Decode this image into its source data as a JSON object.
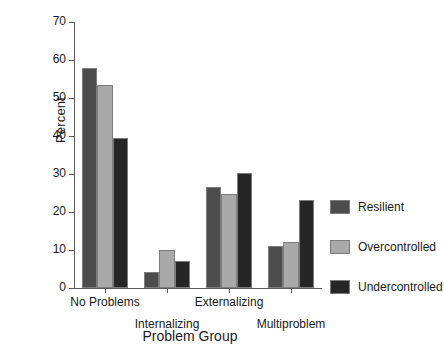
{
  "chart_data": {
    "type": "bar",
    "title": "",
    "xlabel": "Problem Group",
    "ylabel": "Percent",
    "categories": [
      "No Problems",
      "Internalizing",
      "Externalizing",
      "Multiproblem"
    ],
    "series": [
      {
        "name": "Resilient",
        "color": "#4d4d4d",
        "values": [
          58.0,
          4.2,
          26.6,
          11.0
        ]
      },
      {
        "name": "Overcontrolled",
        "color": "#a9a9a9",
        "values": [
          53.3,
          10.0,
          24.7,
          12.1
        ]
      },
      {
        "name": "Undercontrolled",
        "color": "#262626",
        "values": [
          39.5,
          7.1,
          30.3,
          23.1
        ]
      }
    ],
    "ylim": [
      0,
      70
    ],
    "yticks": [
      0,
      10,
      20,
      30,
      40,
      50,
      60,
      70
    ],
    "ytick_labels": [
      "0",
      "10",
      "20",
      "30",
      "40",
      "50",
      "60",
      "70"
    ],
    "grid": false,
    "legend_position": "right"
  },
  "legend": {
    "entries": [
      {
        "label": "Resilient"
      },
      {
        "label": "Overcontrolled"
      },
      {
        "label": "Undercontrolled"
      }
    ]
  }
}
